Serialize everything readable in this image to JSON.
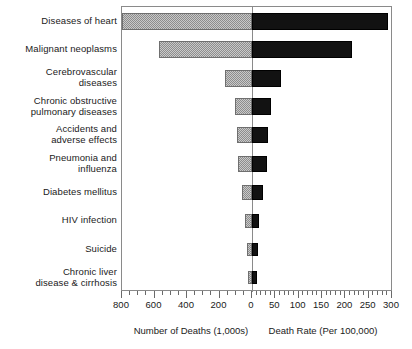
{
  "chart_data": {
    "type": "bar",
    "title": "",
    "subtitle": "",
    "orientation": "horizontal",
    "style": "bidirectional paired horizontal bar chart (tornado)",
    "categories": [
      "Diseases of heart",
      "Malignant neoplasms",
      "Cerebrovascular\ndiseases",
      "Chronic obstructive\npulmonary diseases",
      "Accidents and\nadverse effects",
      "Pneumonia and\ninfluenza",
      "Diabetes mellitus",
      "HIV infection",
      "Suicide",
      "Chronic liver\ndisease & cirrhosis"
    ],
    "series": [
      {
        "name": "Number of Deaths (1,000s)",
        "side": "left",
        "fill": "gray-stipple",
        "axis_label": "Number of Deaths (1,000s)",
        "values": [
          800,
          575,
          168,
          105,
          95,
          85,
          60,
          43,
          32,
          25
        ]
      },
      {
        "name": "Death Rate (Per 100,000)",
        "side": "right",
        "fill": "black",
        "axis_label": "Death Rate (Per 100,000)",
        "values": [
          292,
          215,
          62,
          40,
          35,
          32,
          23,
          16,
          12,
          10
        ]
      }
    ],
    "left_axis": {
      "label": "Number of Deaths (1,000s)",
      "ticks": [
        800,
        600,
        400,
        200,
        0
      ],
      "tick_labels": [
        "800",
        "600",
        "400",
        "200",
        "0"
      ],
      "range": [
        0,
        800
      ],
      "minor_tick_step": 50,
      "direction": "reversed"
    },
    "right_axis": {
      "label": "Death Rate (Per 100,000)",
      "ticks": [
        0,
        50,
        100,
        150,
        200,
        250,
        300
      ],
      "tick_labels": [
        "0",
        "50",
        "100",
        "150",
        "200",
        "250",
        "300"
      ],
      "range": [
        0,
        300
      ],
      "minor_tick_step": 10,
      "direction": "normal"
    },
    "grid": false,
    "legend": "none",
    "annotations": []
  },
  "colors": {
    "left_bar_fill": "#c9c9c9",
    "left_bar_pattern": "#8d8d8d",
    "left_bar_border": "#6f6f6f",
    "right_bar_fill": "#121212",
    "axis_line": "#8a8a8a",
    "tick": "#6a6a6a",
    "text": "#1a1a1a",
    "background": "#ffffff"
  }
}
